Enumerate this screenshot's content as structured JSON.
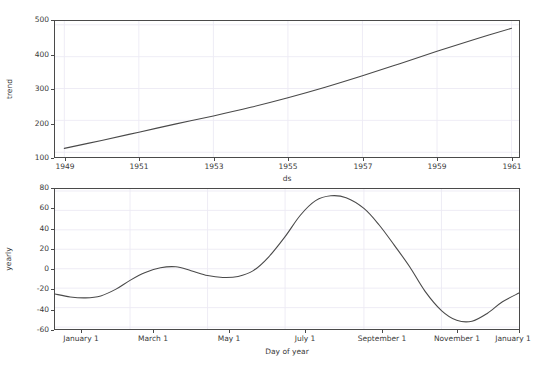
{
  "figure": {
    "background": "#ffffff",
    "line_color": "#4a4a4a",
    "grid_color": "#eceaf4",
    "axis_color": "#4a4a4a",
    "truncated_top_text": ""
  },
  "chart_data": [
    {
      "type": "line",
      "name": "trend",
      "title": "",
      "xlabel": "ds",
      "ylabel": "trend",
      "grid": true,
      "legend": "none",
      "xtick_labels": [
        "1949",
        "1951",
        "1953",
        "1955",
        "1957",
        "1959",
        "1961"
      ],
      "xtick_values": [
        1949,
        1951,
        1953,
        1955,
        1957,
        1959,
        1961
      ],
      "ytick_labels": [
        "100",
        "200",
        "300",
        "400",
        "500"
      ],
      "ytick_values": [
        100,
        200,
        300,
        400,
        500
      ],
      "xlim": [
        1948.75,
        1961.2
      ],
      "ylim": [
        85,
        512
      ],
      "x": [
        1949.0,
        1950.0,
        1951.0,
        1952.0,
        1953.0,
        1954.0,
        1955.0,
        1956.0,
        1957.0,
        1958.0,
        1959.0,
        1960.0,
        1961.0
      ],
      "y": [
        112,
        137,
        163,
        189,
        214,
        241,
        271,
        304,
        340,
        378,
        417,
        454,
        489
      ]
    },
    {
      "type": "line",
      "name": "yearly",
      "title": "",
      "xlabel": "Day of year",
      "ylabel": "yearly",
      "grid": true,
      "legend": "none",
      "xtick_labels": [
        "January 1",
        "March 1",
        "May 1",
        "July 1",
        "September 1",
        "November 1",
        "January 1"
      ],
      "xtick_values": [
        0,
        59,
        120,
        181,
        243,
        304,
        365
      ],
      "ytick_labels": [
        "80",
        "60",
        "40",
        "20",
        "0",
        "-20",
        "-40",
        "-60"
      ],
      "ytick_values": [
        80,
        60,
        40,
        20,
        0,
        -20,
        -40,
        -60
      ],
      "xlim": [
        0,
        365
      ],
      "ylim": [
        -62,
        82
      ],
      "x": [
        0,
        12,
        24,
        36,
        48,
        59,
        71,
        83,
        95,
        107,
        120,
        132,
        144,
        156,
        168,
        181,
        193,
        205,
        217,
        229,
        243,
        255,
        267,
        279,
        291,
        304,
        316,
        328,
        340,
        352,
        365
      ],
      "y": [
        -26,
        -29,
        -30,
        -28,
        -21,
        -12,
        -4,
        1,
        2,
        -2,
        -7,
        -9,
        -8,
        -2,
        12,
        33,
        55,
        70,
        75,
        73,
        62,
        45,
        24,
        2,
        -23,
        -43,
        -53,
        -54,
        -46,
        -34,
        -25
      ]
    }
  ],
  "top_chart": {
    "ylabel": "trend",
    "xlabel": "ds",
    "yticks": [
      "500",
      "400",
      "300",
      "200",
      "100"
    ],
    "xticks": [
      "1949",
      "1951",
      "1953",
      "1955",
      "1957",
      "1959",
      "1961"
    ]
  },
  "bottom_chart": {
    "ylabel": "yearly",
    "xlabel": "Day of year",
    "yticks": [
      "80",
      "60",
      "40",
      "20",
      "0",
      "-20",
      "-40",
      "-60"
    ],
    "xticks": [
      "January 1",
      "March 1",
      "May 1",
      "July 1",
      "September 1",
      "November 1",
      "January 1"
    ]
  }
}
